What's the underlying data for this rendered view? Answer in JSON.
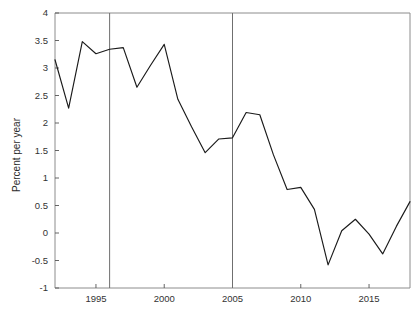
{
  "chart_data": {
    "type": "line",
    "title": "",
    "xlabel": "",
    "ylabel": "Percent per year",
    "xlim": [
      1992,
      2018
    ],
    "ylim": [
      -1,
      4
    ],
    "grid": false,
    "legend": "none",
    "xticks": [
      1995,
      2000,
      2005,
      2010,
      2015
    ],
    "xtick_labels": [
      "1995",
      "2000",
      "2005",
      "2010",
      "2015"
    ],
    "yticks": [
      -1,
      -0.5,
      0,
      0.5,
      1,
      1.5,
      2,
      2.5,
      3,
      3.5,
      4
    ],
    "ytick_labels": [
      "-1",
      "-0.5",
      "0",
      "0.5",
      "1",
      "1.5",
      "2",
      "2.5",
      "3",
      "3.5",
      "4"
    ],
    "x": [
      1992,
      1993,
      1994,
      1995,
      1996,
      1997,
      1998,
      1999,
      2000,
      2001,
      2002,
      2003,
      2004,
      2005,
      2006,
      2007,
      2008,
      2009,
      2010,
      2011,
      2012,
      2013,
      2014,
      2015,
      2016,
      2017,
      2018
    ],
    "values": [
      3.15,
      2.27,
      3.48,
      3.26,
      3.34,
      3.37,
      2.65,
      3.05,
      3.43,
      2.43,
      1.93,
      1.46,
      1.71,
      1.73,
      2.19,
      2.15,
      1.42,
      0.79,
      0.83,
      0.43,
      -0.58,
      0.04,
      0.25,
      -0.02,
      -0.38,
      0.12,
      0.57
    ],
    "series": [
      {
        "name": "Percent per year",
        "color": "#1a1a1a",
        "values": [
          3.15,
          2.27,
          3.48,
          3.26,
          3.34,
          3.37,
          2.65,
          3.05,
          3.43,
          2.43,
          1.93,
          1.46,
          1.71,
          1.73,
          2.19,
          2.15,
          1.42,
          0.79,
          0.83,
          0.43,
          -0.58,
          0.04,
          0.25,
          -0.02,
          -0.38,
          0.12,
          0.57
        ]
      }
    ],
    "vertical_reference_lines": [
      {
        "x": 1996,
        "color": "#6f6f6f"
      },
      {
        "x": 2005,
        "color": "#6f6f6f"
      }
    ],
    "axis_color": "#8c8c8c",
    "background": "#ffffff"
  }
}
